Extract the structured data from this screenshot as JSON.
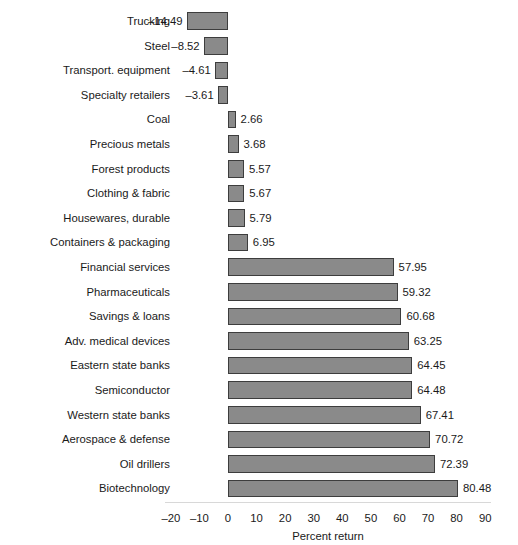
{
  "chart_data": {
    "type": "bar",
    "orientation": "horizontal",
    "title": "",
    "subtitle": "",
    "xlabel": "Percent return",
    "ylabel": "",
    "xlim": [
      -20,
      90
    ],
    "xticks": [
      -20,
      -10,
      0,
      10,
      20,
      30,
      40,
      50,
      60,
      70,
      80,
      90
    ],
    "xtick_labels": [
      "–20",
      "–10",
      "0",
      "10",
      "20",
      "30",
      "40",
      "50",
      "60",
      "70",
      "80",
      "90"
    ],
    "grid": false,
    "legend": null,
    "bar_fill_color": "#8a8a8a",
    "bar_edge_color": "#3d3d3d",
    "background_color": "#ffffff",
    "categories": [
      "Trucking",
      "Steel",
      "Transport. equipment",
      "Specialty retailers",
      "Coal",
      "Precious metals",
      "Forest products",
      "Clothing & fabric",
      "Housewares, durable",
      "Containers & packaging",
      "Financial services",
      "Pharmaceuticals",
      "Savings & loans",
      "Adv. medical devices",
      "Eastern state banks",
      "Semiconductor",
      "Western state banks",
      "Aerospace & defense",
      "Oil drillers",
      "Biotechnology"
    ],
    "values": [
      -14.49,
      -8.52,
      -4.61,
      -3.61,
      2.66,
      3.68,
      5.57,
      5.67,
      5.79,
      6.95,
      57.95,
      59.32,
      60.68,
      63.25,
      64.45,
      64.48,
      67.41,
      70.72,
      72.39,
      80.48
    ],
    "value_labels": [
      "–14.49",
      "–8.52",
      "–4.61",
      "–3.61",
      "2.66",
      "3.68",
      "5.57",
      "5.67",
      "5.79",
      "6.95",
      "57.95",
      "59.32",
      "60.68",
      "63.25",
      "64.45",
      "64.48",
      "67.41",
      "70.72",
      "72.39",
      "80.48"
    ]
  }
}
